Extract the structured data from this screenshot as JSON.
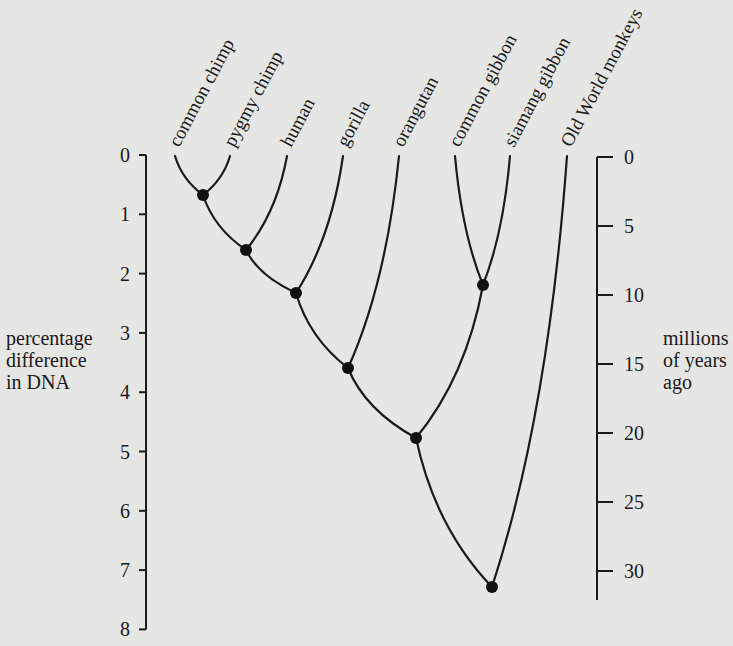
{
  "figure": {
    "type": "phylogenetic-tree",
    "background_color": "#e6e6e4",
    "line_color": "#1a1a1a",
    "taxa": [
      {
        "label": "common chimp",
        "x": 175
      },
      {
        "label": "pygmy chimp",
        "x": 230
      },
      {
        "label": "human",
        "x": 287
      },
      {
        "label": "gorilla",
        "x": 343
      },
      {
        "label": "orangutan",
        "x": 399
      },
      {
        "label": "common gibbon",
        "x": 455
      },
      {
        "label": "siamang gibbon",
        "x": 510
      },
      {
        "label": "Old World monkeys",
        "x": 567
      }
    ],
    "nodes": [
      {
        "id": "chimps",
        "children": [
          "common chimp",
          "pygmy chimp"
        ],
        "dna_diff": 0.7,
        "x": 203,
        "y": 195
      },
      {
        "id": "chimps-human",
        "children": [
          "chimps",
          "human"
        ],
        "dna_diff": 1.6,
        "x": 246,
        "y": 250
      },
      {
        "id": "african-apes",
        "children": [
          "chimps-human",
          "gorilla"
        ],
        "dna_diff": 2.3,
        "x": 296,
        "y": 293
      },
      {
        "id": "great-apes",
        "children": [
          "african-apes",
          "orangutan"
        ],
        "dna_diff": 3.6,
        "x": 348,
        "y": 368
      },
      {
        "id": "gibbons",
        "children": [
          "common gibbon",
          "siamang gibbon"
        ],
        "dna_diff": 2.2,
        "x": 483,
        "y": 285
      },
      {
        "id": "hominoids",
        "children": [
          "great-apes",
          "gibbons"
        ],
        "dna_diff": 4.8,
        "x": 416,
        "y": 438
      },
      {
        "id": "root",
        "children": [
          "hominoids",
          "Old World monkeys"
        ],
        "dna_diff": 7.3,
        "x": 492,
        "y": 587
      }
    ],
    "left_axis": {
      "label_lines": [
        "percentage",
        "difference",
        "in DNA"
      ],
      "ticks": [
        "0",
        "1",
        "2",
        "3",
        "4",
        "5",
        "6",
        "7",
        "8"
      ]
    },
    "right_axis": {
      "label_lines": [
        "millions",
        "of years",
        "ago"
      ],
      "ticks": [
        "0",
        "5",
        "10",
        "15",
        "20",
        "25",
        "30"
      ]
    }
  }
}
